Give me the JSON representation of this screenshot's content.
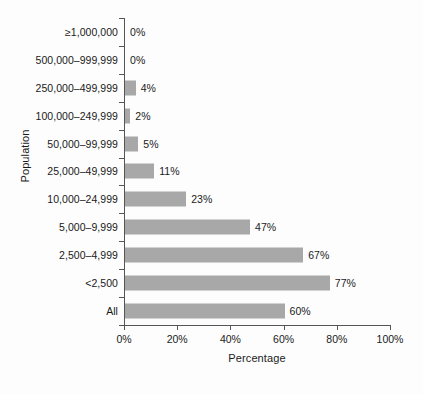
{
  "chart_data": {
    "type": "bar",
    "orientation": "horizontal",
    "title": "",
    "xlabel": "Percentage",
    "ylabel": "Population",
    "categories": [
      "≥1,000,000",
      "500,000–999,999",
      "250,000–499,999",
      "100,000–249,999",
      "50,000–99,999",
      "25,000–49,999",
      "10,000–24,999",
      "5,000–9,999",
      "2,500–4,999",
      "<2,500",
      "All"
    ],
    "values": [
      0,
      0,
      4,
      2,
      5,
      11,
      23,
      47,
      67,
      77,
      60
    ],
    "value_labels": [
      "0%",
      "0%",
      "4%",
      "2%",
      "5%",
      "11%",
      "23%",
      "47%",
      "67%",
      "77%",
      "60%"
    ],
    "xlim": [
      0,
      100
    ],
    "xticks": [
      0,
      20,
      40,
      60,
      80,
      100
    ],
    "xtick_labels": [
      "0%",
      "20%",
      "40%",
      "60%",
      "80%",
      "100%"
    ],
    "grid": false,
    "legend": false,
    "bar_color": "#a8a8a8",
    "axis_color": "#555555",
    "background_color": "#fdfdfd"
  }
}
